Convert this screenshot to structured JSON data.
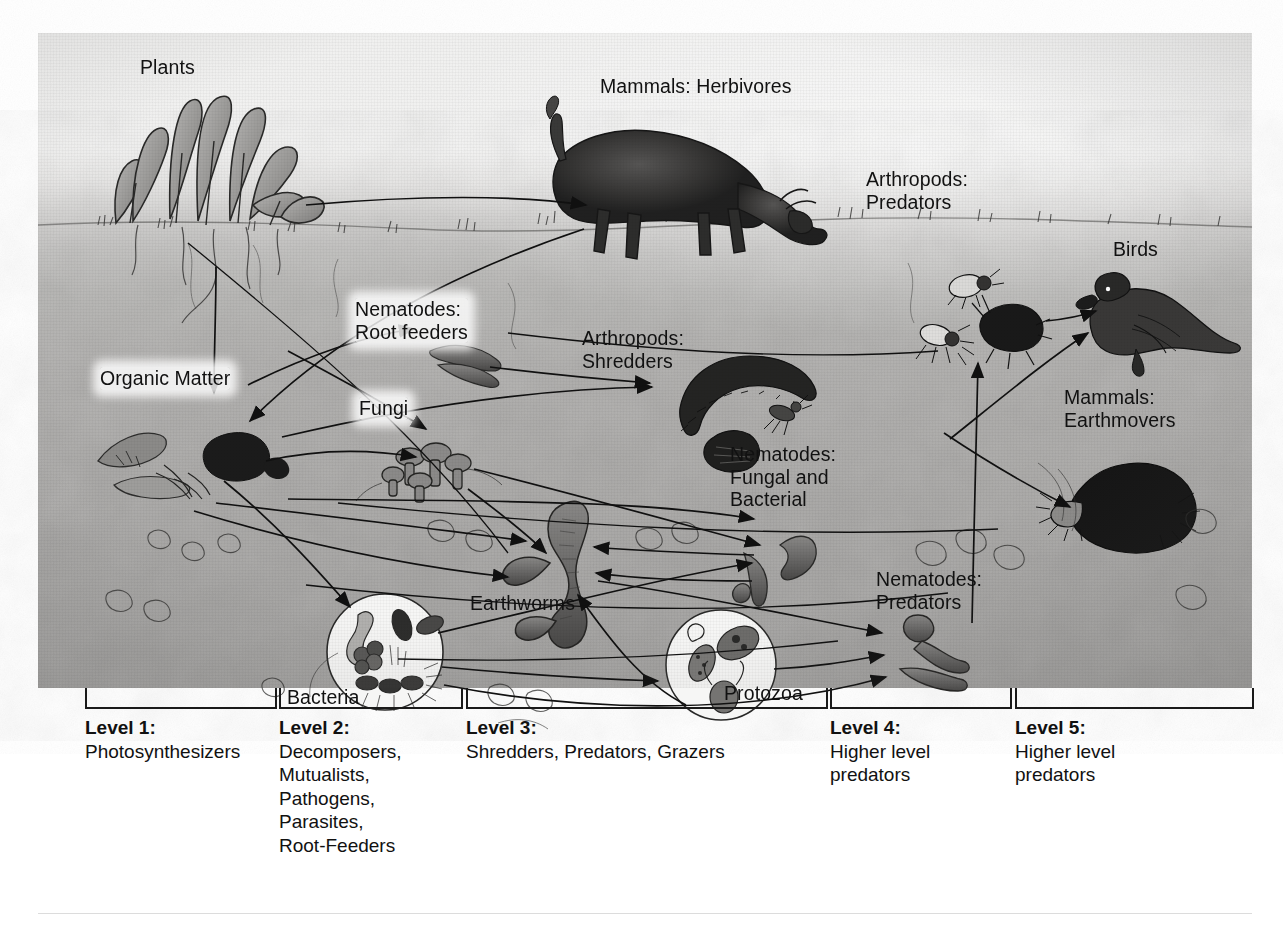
{
  "diagram": {
    "type": "food-web",
    "labels": [
      {
        "id": "plants",
        "text": "Plants",
        "x": 140,
        "y": 56,
        "align": "left",
        "highlight": false
      },
      {
        "id": "mammals-herbivores",
        "text": "Mammals: Herbivores",
        "x": 600,
        "y": 75,
        "align": "left",
        "highlight": false
      },
      {
        "id": "arthropods-predators",
        "text": "Arthropods:\nPredators",
        "x": 866,
        "y": 168,
        "align": "left",
        "highlight": false
      },
      {
        "id": "birds",
        "text": "Birds",
        "x": 1113,
        "y": 238,
        "align": "left",
        "highlight": false
      },
      {
        "id": "nematodes-root",
        "text": "Nematodes:\nRoot feeders",
        "x": 355,
        "y": 298,
        "align": "left",
        "highlight": true
      },
      {
        "id": "organic-matter",
        "text": "Organic Matter",
        "x": 100,
        "y": 367,
        "align": "left",
        "highlight": true
      },
      {
        "id": "arthropods-shredders",
        "text": "Arthropods:\nShredders",
        "x": 582,
        "y": 327,
        "align": "left",
        "highlight": false
      },
      {
        "id": "fungi",
        "text": "Fungi",
        "x": 359,
        "y": 397,
        "align": "left",
        "highlight": true
      },
      {
        "id": "mammals-earthmovers",
        "text": "Mammals:\nEarthmovers",
        "x": 1064,
        "y": 386,
        "align": "left",
        "highlight": false
      },
      {
        "id": "nematodes-fungal-bacterial",
        "text": "Nematodes:\nFungal and\nBacterial",
        "x": 730,
        "y": 443,
        "align": "left",
        "highlight": false
      },
      {
        "id": "earthworms",
        "text": "Earthworms",
        "x": 470,
        "y": 592,
        "align": "left",
        "highlight": false
      },
      {
        "id": "nematodes-predators",
        "text": "Nematodes:\nPredators",
        "x": 876,
        "y": 568,
        "align": "left",
        "highlight": false
      },
      {
        "id": "bacteria",
        "text": "Bacteria",
        "x": 287,
        "y": 686,
        "align": "left",
        "highlight": false
      },
      {
        "id": "protozoa",
        "text": "Protozoa",
        "x": 724,
        "y": 682,
        "align": "left",
        "highlight": false
      }
    ],
    "organisms": [
      {
        "id": "plants",
        "label": "Plants"
      },
      {
        "id": "organic-matter",
        "label": "Organic Matter"
      },
      {
        "id": "mammals-herbivores",
        "label": "Mammals: Herbivores"
      },
      {
        "id": "nematodes-root-feeders",
        "label": "Nematodes: Root feeders"
      },
      {
        "id": "fungi",
        "label": "Fungi"
      },
      {
        "id": "bacteria",
        "label": "Bacteria"
      },
      {
        "id": "arthropods-shredders",
        "label": "Arthropods: Shredders"
      },
      {
        "id": "earthworms",
        "label": "Earthworms"
      },
      {
        "id": "nematodes-fungal-bacterial",
        "label": "Nematodes: Fungal and Bacterial"
      },
      {
        "id": "protozoa",
        "label": "Protozoa"
      },
      {
        "id": "arthropods-predators",
        "label": "Arthropods: Predators"
      },
      {
        "id": "nematodes-predators",
        "label": "Nematodes: Predators"
      },
      {
        "id": "birds",
        "label": "Birds"
      },
      {
        "id": "mammals-earthmovers",
        "label": "Mammals: Earthmovers"
      }
    ],
    "flows": [
      {
        "from": "plants",
        "to": "mammals-herbivores"
      },
      {
        "from": "plants",
        "to": "organic-matter"
      },
      {
        "from": "plants",
        "to": "nematodes-root-feeders"
      },
      {
        "from": "plants",
        "to": "fungi"
      },
      {
        "from": "mammals-herbivores",
        "to": "organic-matter"
      },
      {
        "from": "organic-matter",
        "to": "fungi"
      },
      {
        "from": "organic-matter",
        "to": "bacteria"
      },
      {
        "from": "organic-matter",
        "to": "arthropods-shredders"
      },
      {
        "from": "organic-matter",
        "to": "earthworms"
      },
      {
        "from": "nematodes-root-feeders",
        "to": "arthropods-shredders"
      },
      {
        "from": "fungi",
        "to": "arthropods-shredders"
      },
      {
        "from": "fungi",
        "to": "nematodes-fungal-bacterial"
      },
      {
        "from": "fungi",
        "to": "earthworms"
      },
      {
        "from": "bacteria",
        "to": "protozoa"
      },
      {
        "from": "bacteria",
        "to": "nematodes-fungal-bacterial"
      },
      {
        "from": "bacteria",
        "to": "earthworms"
      },
      {
        "from": "bacteria",
        "to": "nematodes-predators"
      },
      {
        "from": "arthropods-shredders",
        "to": "arthropods-predators"
      },
      {
        "from": "protozoa",
        "to": "nematodes-predators"
      },
      {
        "from": "protozoa",
        "to": "earthworms"
      },
      {
        "from": "nematodes-fungal-bacterial",
        "to": "nematodes-predators"
      },
      {
        "from": "nematodes-fungal-bacterial",
        "to": "earthworms"
      },
      {
        "from": "earthworms",
        "to": "birds"
      },
      {
        "from": "earthworms",
        "to": "mammals-earthmovers"
      },
      {
        "from": "nematodes-predators",
        "to": "arthropods-predators"
      },
      {
        "from": "arthropods-predators",
        "to": "birds"
      }
    ]
  },
  "legend": {
    "levels": [
      {
        "number": "Level 1:",
        "desc": "Photosynthesizers",
        "bracket_x": 85,
        "bracket_w": 188,
        "label_x": 85
      },
      {
        "number": "Level 2:",
        "desc": "Decomposers,\nMutualists,\nPathogens,\nParasites,\nRoot-Feeders",
        "bracket_x": 279,
        "bracket_w": 180,
        "label_x": 279
      },
      {
        "number": "Level 3:",
        "desc": "Shredders, Predators, Grazers",
        "bracket_x": 466,
        "bracket_w": 358,
        "label_x": 466
      },
      {
        "number": "Level 4:",
        "desc": "Higher level\npredators",
        "bracket_x": 830,
        "bracket_w": 178,
        "label_x": 830
      },
      {
        "number": "Level 5:",
        "desc": "Higher level\npredators",
        "bracket_x": 1015,
        "bracket_w": 235,
        "label_x": 1015
      }
    ]
  },
  "colors": {
    "ink": "#111111",
    "soil_top": "#cfccc6",
    "soil_deep": "#a39f97",
    "sky": "#f4f3f0",
    "highlight": "#ffffff"
  }
}
